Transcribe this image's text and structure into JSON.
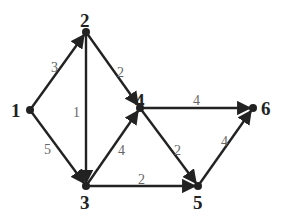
{
  "graph": {
    "directed": true,
    "nodes": [
      {
        "id": "1",
        "label": "1",
        "x": 30,
        "y": 110
      },
      {
        "id": "2",
        "label": "2",
        "x": 86,
        "y": 32
      },
      {
        "id": "3",
        "label": "3",
        "x": 86,
        "y": 186
      },
      {
        "id": "4",
        "label": "4",
        "x": 140,
        "y": 108
      },
      {
        "id": "5",
        "label": "5",
        "x": 198,
        "y": 186
      },
      {
        "id": "6",
        "label": "6",
        "x": 253,
        "y": 108
      }
    ],
    "edges": [
      {
        "from": "1",
        "to": "2",
        "weight": "3"
      },
      {
        "from": "1",
        "to": "3",
        "weight": "5"
      },
      {
        "from": "2",
        "to": "3",
        "weight": "1"
      },
      {
        "from": "2",
        "to": "4",
        "weight": "2"
      },
      {
        "from": "3",
        "to": "4",
        "weight": "4"
      },
      {
        "from": "3",
        "to": "5",
        "weight": "2"
      },
      {
        "from": "4",
        "to": "6",
        "weight": "4"
      },
      {
        "from": "4",
        "to": "5",
        "weight": "2"
      },
      {
        "from": "5",
        "to": "6",
        "weight": "4"
      }
    ]
  },
  "labels": {
    "n1": "1",
    "n2": "2",
    "n3": "3",
    "n4": "4",
    "n5": "5",
    "n6": "6",
    "w12": "3",
    "w13": "5",
    "w23": "1",
    "w24": "2",
    "w34": "4",
    "w35": "2",
    "w46": "4",
    "w45": "2",
    "w56": "4"
  },
  "colors": {
    "edge": "#222222",
    "node": "#222222",
    "weight_text": "#666666",
    "background": "#ffffff"
  }
}
